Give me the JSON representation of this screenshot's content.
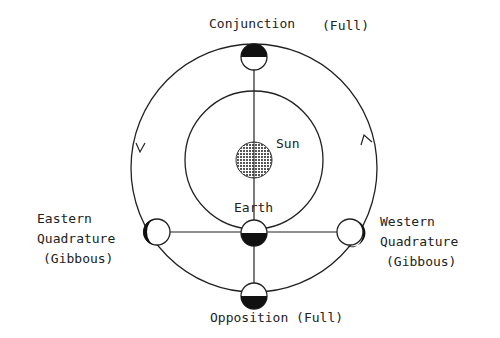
{
  "diagram": {
    "labels": {
      "conjunction": "Conjunction",
      "conjunction_phase": "(Full)",
      "sun": "Sun",
      "earth": "Earth",
      "eastern_line1": "Eastern",
      "eastern_line2": "Quadrature",
      "eastern_line3": "(Gibbous)",
      "western_line1": "Western",
      "western_line2": "Quadrature",
      "western_line3": "(Gibbous)",
      "opposition": "Opposition (Full)"
    },
    "colors": {
      "line": "#222222",
      "shadow": "#111111",
      "sun_fill": "#9a9a9a"
    }
  }
}
